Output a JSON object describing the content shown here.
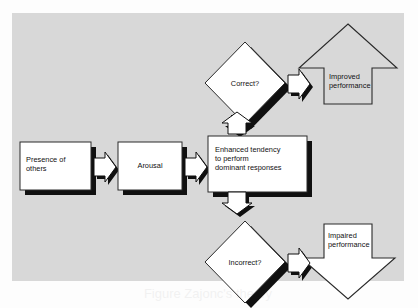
{
  "figure": {
    "panel_background": "#d8d8d8",
    "page_background": "#fdfdfd",
    "shadow_color": "#101010",
    "outline_color": "#1a1a1a",
    "fill_white": "#ffffff",
    "text_color": "#111111"
  },
  "nodes": {
    "presence": {
      "label": "Presence of\nothers",
      "shape": "box",
      "fill": "#ffffff",
      "align": "left"
    },
    "arousal": {
      "label": "Arousal",
      "shape": "box",
      "fill": "#ffffff",
      "align": "center"
    },
    "enhanced": {
      "label": "Enhanced tendency\nto perform\ndominant responses",
      "shape": "box",
      "fill": "#ffffff",
      "align": "left"
    },
    "correct": {
      "label": "Correct?",
      "shape": "diamond",
      "fill": "#ffffff",
      "align": "center"
    },
    "incorrect": {
      "label": "Incorrect?",
      "shape": "diamond",
      "fill": "#ffffff",
      "align": "center"
    },
    "improved": {
      "label": "Improved\nperformance",
      "shape": "up-arrow-block",
      "fill": "#d8d8d8",
      "align": "left"
    },
    "impaired": {
      "label": "Impaired\nperformance",
      "shape": "down-arrow-block",
      "fill": "#ffffff",
      "align": "left"
    }
  },
  "connectors": [
    {
      "name": "presence-to-arousal",
      "direction": "right"
    },
    {
      "name": "arousal-to-enhanced",
      "direction": "right"
    },
    {
      "name": "enhanced-to-correct",
      "direction": "up"
    },
    {
      "name": "enhanced-to-incorrect",
      "direction": "down"
    },
    {
      "name": "correct-to-improved",
      "direction": "right"
    },
    {
      "name": "incorrect-to-impaired",
      "direction": "right"
    }
  ],
  "caption": {
    "text": "Figure  Zajonc's theory"
  }
}
